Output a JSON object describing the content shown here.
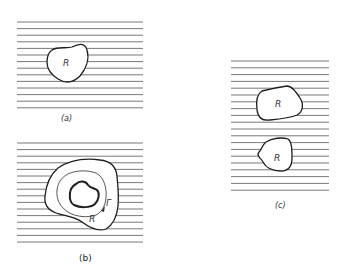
{
  "figure": {
    "panels": [
      {
        "id": "a",
        "caption": "(a)",
        "regions": [
          {
            "label": "R"
          }
        ],
        "line_count": 14
      },
      {
        "id": "b",
        "caption": "(b)",
        "regions": [
          {
            "label": "R"
          }
        ],
        "contour_label": "Γ",
        "line_count": 16
      },
      {
        "id": "c",
        "caption": "(c)",
        "regions": [
          {
            "label": "R"
          },
          {
            "label": "R"
          }
        ],
        "line_count": 20
      }
    ],
    "colors": {
      "lines": "#6a6a6a",
      "outline": "#1e1e1e",
      "background": "#ffffff"
    }
  }
}
